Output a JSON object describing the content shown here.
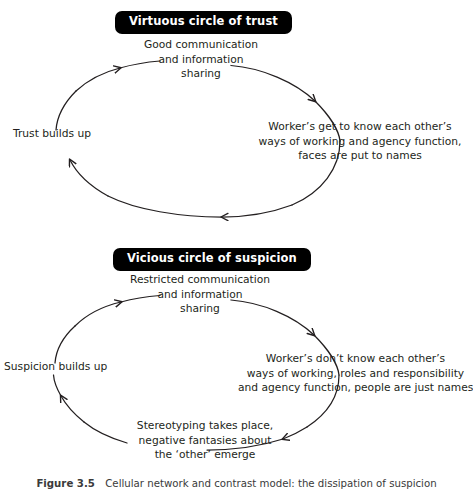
{
  "figure": {
    "caption_label": "Figure 3.5",
    "caption_text": "Cellular network and contrast model: the dissipation of suspicion"
  },
  "colors": {
    "badge_background": "#000000",
    "badge_text": "#ffffff",
    "text": "#231f20",
    "arrow_stroke": "#231f20",
    "page_background": "#ffffff"
  },
  "cycles": [
    {
      "id": "virtuous-circle-of-trust",
      "badge": "Virtuous circle of trust",
      "nodes": {
        "top": "Good communication\nand information\nsharing",
        "right": "Worker’s get to know each other’s\nways of working and agency function,\nfaces are put to names",
        "left": "Trust builds up"
      },
      "arrows": [
        {
          "name": "arrow-top-right",
          "direction": "clockwise-descending-right"
        },
        {
          "name": "arrow-bottom-left",
          "direction": "leftward-along-bottom"
        },
        {
          "name": "arrow-left-up",
          "direction": "upward-along-left"
        },
        {
          "name": "arrow-left-lower",
          "direction": "upward-into-left-label"
        }
      ],
      "ellipse": {
        "cx": 196,
        "cy": 139,
        "rx": 144,
        "ry": 79
      }
    },
    {
      "id": "vicious-circle-of-suspicion",
      "badge": "Vicious circle of suspicion",
      "nodes": {
        "top": "Restricted communication\nand information\nsharing",
        "right": "Worker’s don’t know each other’s\nways of working, roles and responsibility\nand agency function, people are just names",
        "bottom": "Stereotyping takes place,\nnegative fantasies about\nthe ‘other’ emerge",
        "left": "Suspicion builds up"
      },
      "arrows": [
        {
          "name": "arrow-top-right",
          "direction": "clockwise-descending-right"
        },
        {
          "name": "arrow-right-bottom",
          "direction": "descending-into-bottom-node"
        },
        {
          "name": "arrow-bottom-left",
          "direction": "upward-along-left"
        },
        {
          "name": "arrow-left-up",
          "direction": "upward-into-top-node"
        }
      ],
      "ellipse": {
        "cx": 196,
        "cy": 373,
        "rx": 143,
        "ry": 78
      }
    }
  ]
}
